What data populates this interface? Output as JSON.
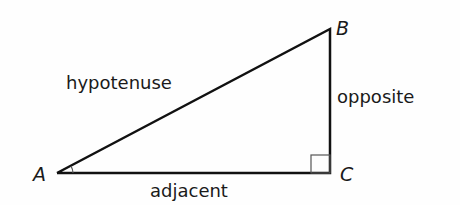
{
  "diagram": {
    "type": "right-triangle",
    "vertices": [
      {
        "id": "A",
        "label": "A",
        "x": 57,
        "y": 173
      },
      {
        "id": "B",
        "label": "B",
        "x": 328,
        "y": 29
      },
      {
        "id": "C",
        "label": "C",
        "x": 330,
        "y": 173
      }
    ],
    "sides": {
      "hypotenuse": "hypotenuse",
      "opposite": "opposite",
      "adjacent": "adjacent"
    },
    "right_angle_at": "C",
    "stroke_color": "#111111"
  }
}
